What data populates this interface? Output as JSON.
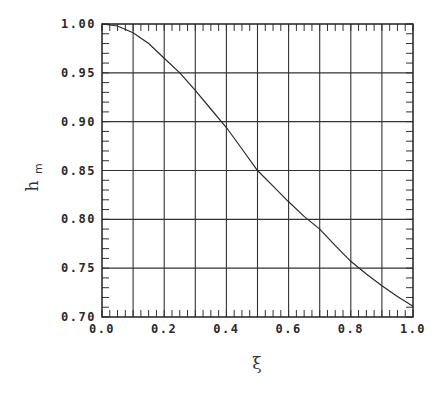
{
  "chart_data": {
    "type": "line",
    "title": "",
    "xlabel": "ξ",
    "ylabel": "h",
    "ylabel_subscript": "m",
    "xlim": [
      0.0,
      1.0
    ],
    "ylim": [
      0.7,
      1.0
    ],
    "grid": true,
    "legend": null,
    "x_ticks": [
      0.0,
      0.2,
      0.4,
      0.6,
      0.8,
      1.0
    ],
    "x_tick_labels": [
      "0.0",
      "0.2",
      "0.4",
      "0.6",
      "0.8",
      "1.0"
    ],
    "x_gridlines": [
      0.1,
      0.2,
      0.3,
      0.4,
      0.5,
      0.6,
      0.7,
      0.8,
      0.9
    ],
    "x_minor_step": 0.025,
    "y_ticks": [
      0.7,
      0.75,
      0.8,
      0.85,
      0.9,
      0.95,
      1.0
    ],
    "y_tick_labels": [
      "0.70",
      "0.75",
      "0.80",
      "0.85",
      "0.90",
      "0.95",
      "1.00"
    ],
    "y_gridlines": [
      0.75,
      0.8,
      0.85,
      0.9,
      0.95
    ],
    "y_minor_step": 0.01,
    "series": [
      {
        "name": "h_m",
        "x": [
          0.0,
          0.05,
          0.1,
          0.15,
          0.2,
          0.25,
          0.3,
          0.35,
          0.4,
          0.45,
          0.5,
          0.55,
          0.6,
          0.65,
          0.7,
          0.75,
          0.8,
          0.85,
          0.9,
          0.95,
          1.0
        ],
        "values": [
          1.0,
          0.998,
          0.991,
          0.98,
          0.965,
          0.95,
          0.932,
          0.913,
          0.894,
          0.872,
          0.85,
          0.834,
          0.818,
          0.803,
          0.79,
          0.773,
          0.757,
          0.744,
          0.732,
          0.721,
          0.711
        ]
      }
    ]
  },
  "axes": {
    "xlabel": "ξ",
    "ylabel_main": "h",
    "ylabel_sub": "m"
  }
}
